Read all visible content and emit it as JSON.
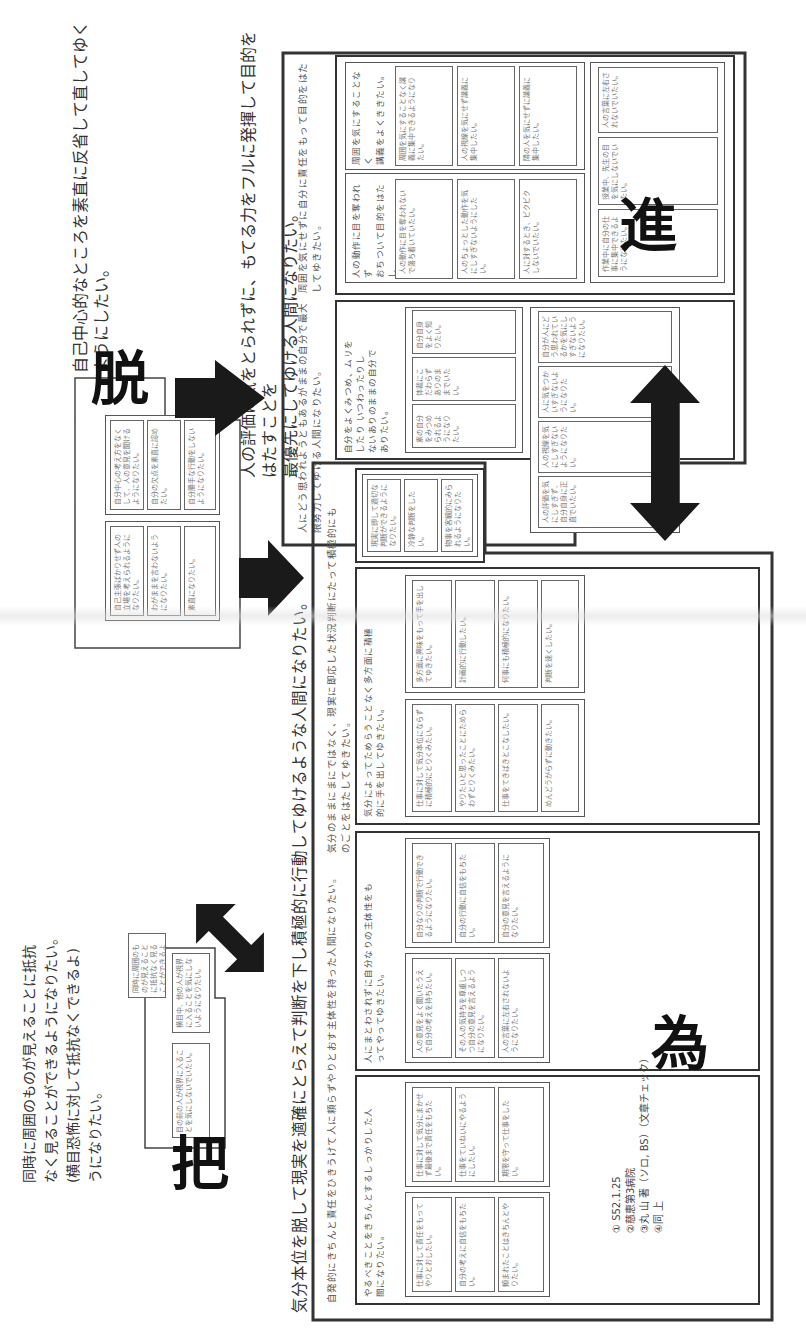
{
  "document": {
    "orientation": "rotated-90-ccw",
    "sections": {
      "ha": {
        "glyph": "把",
        "goal": "同時に周囲のものが見えることに抵抗なく見ることができるようになりたい。(横目恐怖に対して抵抗なくできるようになりたい。)",
        "goal_lines": [
          "同時に周囲のものが見えることに抵抗",
          "なく見ることができるようになりたい。",
          "(横目恐怖に対して抵抗なくできるよ)",
          "うになりたい。"
        ],
        "cards": [
          "同時に周囲のものが見えることに抵抗なく見ることができるようになりたい。",
          "横目中、他の人が視界に入ることを気にしないようになりたい。",
          "目の前の人が視界に入ることを気にしないでいたい。"
        ]
      },
      "datsu": {
        "glyph": "脱",
        "goal_lines": [
          "自己中心的なところを素直に反省して直してゆく",
          "ようにしたい。"
        ],
        "cards": [
          "自分中心の考え方をなくして、人の意見を聞けるようになりたい。",
          "自分の欠点を素直に認めたい。",
          "自分勝手な行動をしないようになりたい。",
          "自己主張ばかりせず人の立場を考えられるようになりたい。",
          "わがままを言わないようになりたい。",
          "素直になりたい。"
        ]
      },
      "shin": {
        "glyph": "進",
        "goal_lines": [
          "人の評価に気をとられずに、もてる力をフルに発揮して目的をはたすことを",
          "最優先にしてゆける人間になりたい。"
        ],
        "sub_left": [
          "人にどう思われようともあるがままの自分で最大",
          "限努力してゆける人間になりたい。"
        ],
        "sub_right": [
          "周囲を気にせずに自分に責任をもって目的をはた",
          "してゆきたい。"
        ],
        "groups": [
          {
            "title_lines": [
              "人の動作に目を奪われず",
              "おちついて目的をはたし",
              "てゆきたい。"
            ],
            "cards": [
              "人の動作に目を奪われないで落ち着いていたい。",
              "人のちょっとした動作を気にしすぎないようにしたい。",
              "人に対するとき、ビクビクしないでいたい。"
            ]
          },
          {
            "title_lines": [
              "周囲を気にすることなく",
              "講義をよくききたい。"
            ],
            "cards": [
              "周囲を気にすることなく講義に集中できるようになりたい。",
              "人の視線を気にせず講義に集中したい。",
              "隣の人を気にせずに講義に集中したい。"
            ]
          },
          {
            "title_lines": [
              "自分をよくみつめ、ムリを",
              "したり いつわったりし",
              "ないありのままの自分で",
              "ありたい。"
            ],
            "cards": [
              "素の自分をみつめられるようになりたい。",
              "体裁にこだわらずありのままでいたい。",
              "自分自身をよく知りたい。"
            ]
          },
          {
            "title_lines": [],
            "cards": [
              "人の評価を気にしすぎず、自分自身に正直でいたい。",
              "人の視線を気にしすぎないようになりたい。",
              "人に気をつかいすぎないようになりたい。",
              "自分が人にどう思われているかを気にしすぎないようになりたい。"
            ]
          },
          {
            "title_lines": [],
            "cards": [
              "作業中に自分の仕事に集中できるようになりたい。",
              "授業中、先生の目を気にしないでいたい。",
              "人の言葉に左右されないでいたい。"
            ]
          },
          {
            "title_lines": [],
            "cards": [
              "自分の仕事に責任をもちたい。",
              "人の評価より自分の基準で判断したい。",
              "自分のペースを守りたい。"
            ]
          }
        ]
      },
      "i": {
        "glyph": "為",
        "goal_lines": [
          "気分本位を脱して現実を適確にとらえて判断を下し積極的に行動してゆけるような人間になりたい。"
        ],
        "sub_left": [
          "自発的にきちんと責任をひきうけて人に頼らずやりとおす主体性を持った人間になりたい。"
        ],
        "sub_right": [
          "気分のままにまにではなく、現実に即応した状況判断にたって積極的にも",
          "のごとをはたしてゆきたい。"
        ],
        "groups": [
          {
            "title_lines": [
              "やるべきことをきちんとするしっかりした人",
              "間になりたい。"
            ],
            "cards": [
              "仕事に対して責任をもってやりとおしたい。",
              "自分の考えに自信をもちたい。",
              "頼まれたことはきちんとやりたい。",
              "仕事に対して気分にまかせず最後まで責任をもちたい。",
              "仕事をていねいにやるようにしたい。",
              "期限を守って仕事をしたい。"
            ]
          },
          {
            "title_lines": [
              "人にまとわされずに自分なりの主体性をも",
              "ってやってゆきたい。"
            ],
            "cards": [
              "人の意見をよく聞いたうえで自分の考えを持ちたい。",
              "その人の気持ちを尊重しつつ自分の意見を言えるようになりたい。",
              "人の言葉に左右されないようになりたい。",
              "自分なりの判断で行動できるようになりたい。",
              "自分の行動に自信をもちたい。",
              "自分の意見を言えるようになりたい。"
            ]
          },
          {
            "title_lines": [
              "気分によってためらうことなく多方面に積極",
              "的に手を出してゆきたい。"
            ],
            "cards": [
              "仕事に対して気分本位にならずに積極的にとりくみたい。",
              "やりたいと思ったことにためらわずとりくみたい。",
              "仕事をてきぱきとこなしたい。",
              "めんどうがらずに動きたい。",
              "多方面に興味をもって手を出してゆきたい。",
              "計画的に行動したい。",
              "何事にも積極的になりたい。",
              "判断を速くしたい。"
            ]
          },
          {
            "title_lines": [],
            "cards": [
              "現実に即して適切な判断ができるようになりたい。",
              "冷静な判断をしたい。",
              "物事を客観的にみられるようになりたい。"
            ]
          }
        ]
      }
    },
    "footer_notes": [
      "① S52.1.25",
      "②慈恵第3病院",
      "③丸 山 著（ソロ, BS）（文章チェック）",
      "④同 上"
    ]
  }
}
